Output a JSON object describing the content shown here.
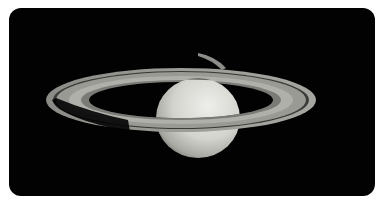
{
  "image": {
    "subject": "Saturn with rings",
    "background_color": "#020202",
    "page_color": "#ffffff"
  }
}
